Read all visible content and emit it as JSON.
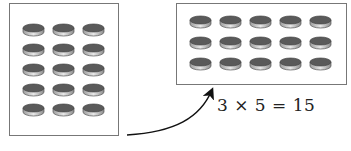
{
  "figure": {
    "left_array": {
      "rows": 5,
      "cols": 3,
      "label": "5 by 3 array of counters"
    },
    "right_array": {
      "rows": 3,
      "cols": 5,
      "label": "3 by 5 array of counters"
    },
    "equation": "3 × 5 = 15",
    "arrow": "curved arrow from left array to right array"
  },
  "colors": {
    "border": "#777777",
    "disk_top": "#5a5a5a",
    "disk_side": "#c8c8c8",
    "text": "#222222"
  }
}
